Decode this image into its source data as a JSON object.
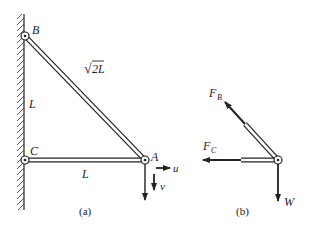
{
  "figure_a": {
    "caption": "(a)",
    "points": {
      "B": "B",
      "C": "C",
      "A": "A"
    },
    "member_BA_label": "√2L",
    "member_BA_sqrt": "√",
    "member_BA_rest": "2L",
    "wall_length_label": "L",
    "member_CA_label": "L",
    "displacement_u": "u",
    "displacement_v": "v"
  },
  "figure_b": {
    "caption": "(b)",
    "force_B": {
      "main": "F",
      "sub": "B"
    },
    "force_C": {
      "main": "F",
      "sub": "C"
    },
    "weight": "W"
  },
  "colors": {
    "ink": "#222222",
    "background": "#ffffff"
  }
}
